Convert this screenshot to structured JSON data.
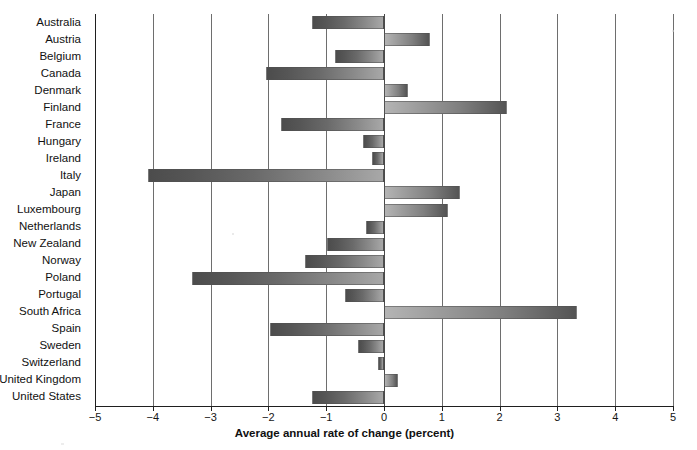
{
  "chart_data": {
    "type": "bar",
    "orientation": "horizontal",
    "title": "",
    "subtitle": "",
    "xlabel": "Average annual rate of change (percent)",
    "ylabel": "",
    "xlim": [
      -5,
      5
    ],
    "xticks": [
      -5,
      -4,
      -3,
      -2,
      -1,
      0,
      1,
      2,
      3,
      4,
      5
    ],
    "xticklabels": [
      "−5",
      "−4",
      "−3",
      "−2",
      "−1",
      "0",
      "1",
      "2",
      "3",
      "4",
      "5"
    ],
    "grid": true,
    "grid_axis": "x",
    "legend": "none",
    "categories": [
      "Australia",
      "Austria",
      "Belgium",
      "Canada",
      "Denmark",
      "Finland",
      "France",
      "Hungary",
      "Ireland",
      "Italy",
      "Japan",
      "Luxembourg",
      "Netherlands",
      "New Zealand",
      "Norway",
      "Poland",
      "Portugal",
      "South Africa",
      "Spain",
      "Sweden",
      "Switzerland",
      "United Kingdom",
      "United States"
    ],
    "values": [
      -1.24,
      0.79,
      -0.84,
      -2.05,
      0.42,
      2.12,
      -1.79,
      -0.36,
      -0.21,
      -4.09,
      1.31,
      1.1,
      -0.31,
      -0.98,
      -1.36,
      -3.33,
      -0.67,
      3.34,
      -1.98,
      -0.45,
      -0.1,
      0.24,
      -1.24
    ],
    "series": [
      {
        "name": "Average annual rate of change",
        "values": [
          -1.24,
          0.79,
          -0.84,
          -2.05,
          0.42,
          2.12,
          -1.79,
          -0.36,
          -0.21,
          -4.09,
          1.31,
          1.1,
          -0.31,
          -0.98,
          -1.36,
          -3.33,
          -0.67,
          3.34,
          -1.98,
          -0.45,
          -0.1,
          0.24,
          -1.24
        ]
      }
    ],
    "colors": {
      "negative_bar": "#6a6a6a",
      "positive_bar": "#8a8a8a",
      "gridline": "#6e6e6e",
      "axis": "#1f1f1f",
      "background": "#ffffff"
    }
  }
}
